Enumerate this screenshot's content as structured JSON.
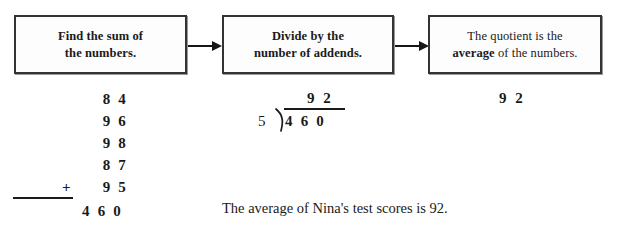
{
  "flowchart": {
    "steps": [
      {
        "id": "step-1",
        "line1": "Find the sum of",
        "line2": "the numbers."
      },
      {
        "id": "step-2",
        "line1": "Divide by the",
        "line2": "number of addends."
      },
      {
        "id": "step-3",
        "line1": "The quotient is the",
        "line2_pre": "",
        "line2_bold": "average",
        "line2_post": " of the numbers."
      }
    ],
    "arrows": [
      "arrow-right",
      "arrow-right"
    ]
  },
  "work": {
    "addition": {
      "addends": [
        "8 4",
        "9 6",
        "9 8",
        "8 7",
        "9 5"
      ],
      "operator": "+",
      "sum": "4 6 0"
    },
    "division": {
      "divisor": "5",
      "dividend": "4 6 0",
      "quotient": "9 2",
      "bracket": "division-bracket"
    },
    "result": "9 2"
  },
  "conclusion": "The average of Nina's test scores is 92.",
  "colors": {
    "ink": "#1a1a1a",
    "box_border": "#333333",
    "box_fill": "#fdfdfd",
    "page_background": "#ffffff"
  }
}
